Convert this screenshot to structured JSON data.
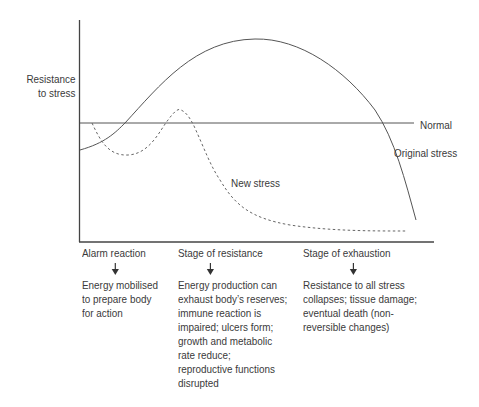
{
  "diagram": {
    "y_axis_label": [
      "Resistance",
      "to stress"
    ],
    "curve_labels": {
      "normal": "Normal",
      "original": "Original stress",
      "new": "New stress"
    },
    "stages": [
      {
        "heading": "Alarm reaction",
        "description": [
          "Energy mobilised",
          "to prepare body",
          "for action"
        ]
      },
      {
        "heading": "Stage of resistance",
        "description": [
          "Energy production can",
          "exhaust body’s reserves;",
          "immune reaction is",
          "impaired; ulcers form;",
          "growth and metabolic",
          "rate reduce;",
          "reproductive functions",
          "disrupted"
        ]
      },
      {
        "heading": "Stage of exhaustion",
        "description": [
          "Resistance to all stress",
          "collapses; tissue damage;",
          "eventual death (non-",
          "reversible changes)"
        ]
      }
    ],
    "colors": {
      "line": "#555555",
      "text": "#3a3a3a"
    }
  }
}
